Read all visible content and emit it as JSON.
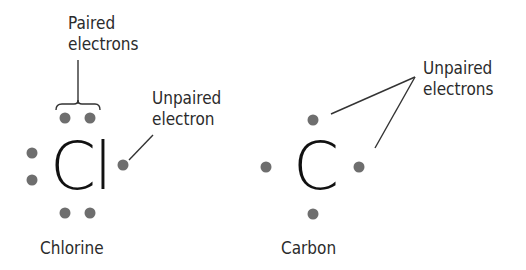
{
  "diagram": {
    "chlorine": {
      "symbol": "Cl",
      "name": "Chlorine",
      "valence_electrons": 7,
      "paired_label": [
        "Paired",
        "electrons"
      ],
      "unpaired_label": [
        "Unpaired",
        "electron"
      ]
    },
    "carbon": {
      "symbol": "C",
      "name": "Carbon",
      "valence_electrons": 4,
      "unpaired_label": [
        "Unpaired",
        "electrons"
      ]
    },
    "colors": {
      "electron_dot": "#6e6e6e",
      "symbol": "#111111",
      "label": "#2b2b2b",
      "leader_line": "#333333"
    }
  }
}
